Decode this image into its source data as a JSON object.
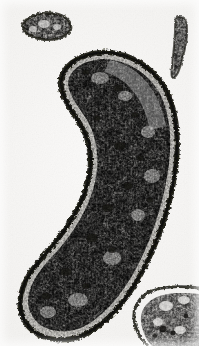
{
  "image": {
    "kind": "histology-micrograph",
    "modality": "light-microscopy",
    "staining": "grayscale",
    "width_px": 199,
    "height_px": 346,
    "background_color": "#f5f4f2",
    "ink_color": "#1a1a18",
    "midtone_color": "#6b6a66",
    "description": "Curved crescent-shaped tissue section with dark epithelial rim and vacuolated interior",
    "alt_text": "Black and white histological section of an elongated, crescent shaped organ with a densely stained outer layer and a pale, heavily vacuolated inner parenchyma, surrounded by three smaller tissue fragments"
  },
  "specimens": [
    {
      "name": "main-specimen",
      "label": "central crescent tissue section",
      "position": "center",
      "orientation": "curved, concave toward lower-left",
      "bounds_px": {
        "x": 20,
        "y": 50,
        "width": 158,
        "height": 290
      },
      "features": {
        "cortex": "dark continuous stained outer rim",
        "medulla": "pale vacuolated parenchyma with scattered dark granular clusters"
      }
    },
    {
      "name": "fragment-top-left",
      "label": "upper left tissue fragment",
      "position": "top-left",
      "bounds_px": {
        "x": 22,
        "y": 12,
        "width": 50,
        "height": 28
      }
    },
    {
      "name": "fragment-right-edge",
      "label": "right margin tissue sliver",
      "position": "right-edge",
      "bounds_px": {
        "x": 172,
        "y": 16,
        "width": 16,
        "height": 62
      }
    },
    {
      "name": "fragment-bottom-right",
      "label": "lower right tissue fragment",
      "position": "bottom-right",
      "bounds_px": {
        "x": 133,
        "y": 286,
        "width": 66,
        "height": 60
      }
    }
  ],
  "palette": {
    "background": "#f5f4f2",
    "paper_highlight": "#fbfaf9",
    "paper_shadow": "#eeedeb",
    "tissue_dark": "#111110",
    "tissue_rim": "#2a2926",
    "tissue_mid": "#6e6c67",
    "tissue_light": "#cfcdc8",
    "vacuole": "#f2f1ee"
  }
}
